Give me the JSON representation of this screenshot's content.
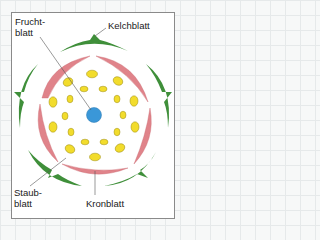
{
  "diagram": {
    "labels": {
      "fruchtblatt": "Frucht-\nblatt",
      "kelchblatt": "Kelchblatt",
      "staubblatt": "Staub-\nblatt",
      "kronblatt": "Kronblatt"
    },
    "colors": {
      "kelchblatt": "#3f8f3a",
      "kronblatt": "#e0838a",
      "staubblatt": "#f2dc2c",
      "fruchtblatt": "#3a97d8",
      "leader_line": "#555555",
      "frame": "#8a8a8a"
    },
    "counts": {
      "kelchblaetter": 5,
      "kronblaetter": 5,
      "staubblaetter_outer": 10,
      "staubblaetter_inner": 10,
      "fruchtblaetter": 1
    }
  }
}
